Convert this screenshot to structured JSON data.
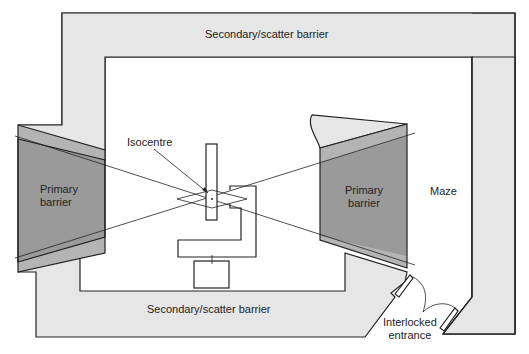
{
  "labels": {
    "top_barrier": "Secondary/scatter barrier",
    "bottom_barrier": "Secondary/scatter barrier",
    "isocentre": "Isocentre",
    "primary_left_1": "Primary",
    "primary_left_2": "barrier",
    "primary_right_1": "Primary",
    "primary_right_2": "barrier",
    "maze": "Maze",
    "entrance_1": "Interlocked",
    "entrance_2": "entrance"
  },
  "colors": {
    "secondary_fill": "#e6e6e6",
    "primary_fill": "#9a9a9a",
    "primary_light_fill": "#b4b4b4",
    "line": "#222222"
  }
}
